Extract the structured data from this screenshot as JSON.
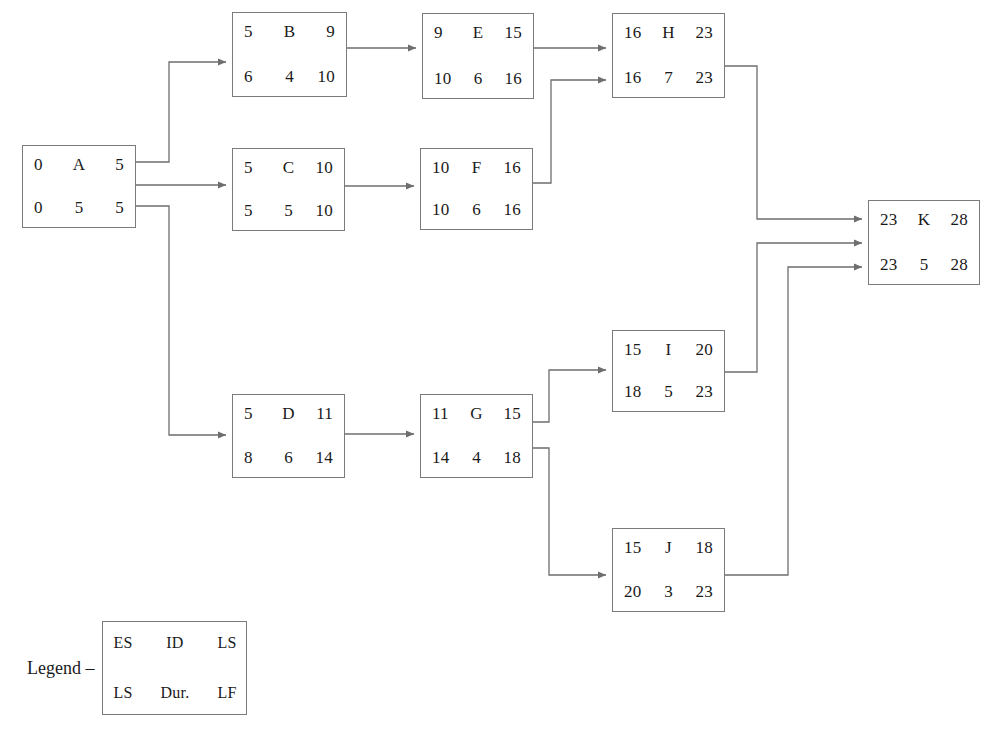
{
  "diagram": {
    "legend": {
      "label": "Legend –",
      "top_row": [
        "ES",
        "ID",
        "LS"
      ],
      "bottom_row": [
        "LS",
        "Dur.",
        "LF"
      ]
    },
    "colors": {
      "background": "#ffffff",
      "box_border": "#7b7b7b",
      "edge_line": "#6e6e6e",
      "text": "#1a1a1a"
    },
    "nodes": [
      {
        "key": "A",
        "id": "A",
        "es": "0",
        "ls_top": "5",
        "ls_bottom": "0",
        "dur": "5",
        "lf": "5"
      },
      {
        "key": "B",
        "id": "B",
        "es": "5",
        "ls_top": "9",
        "ls_bottom": "6",
        "dur": "4",
        "lf": "10"
      },
      {
        "key": "C",
        "id": "C",
        "es": "5",
        "ls_top": "10",
        "ls_bottom": "5",
        "dur": "5",
        "lf": "10"
      },
      {
        "key": "D",
        "id": "D",
        "es": "5",
        "ls_top": "11",
        "ls_bottom": "8",
        "dur": "6",
        "lf": "14"
      },
      {
        "key": "E",
        "id": "E",
        "es": "9",
        "ls_top": "15",
        "ls_bottom": "10",
        "dur": "6",
        "lf": "16"
      },
      {
        "key": "F",
        "id": "F",
        "es": "10",
        "ls_top": "16",
        "ls_bottom": "10",
        "dur": "6",
        "lf": "16"
      },
      {
        "key": "G",
        "id": "G",
        "es": "11",
        "ls_top": "15",
        "ls_bottom": "14",
        "dur": "4",
        "lf": "18"
      },
      {
        "key": "H",
        "id": "H",
        "es": "16",
        "ls_top": "23",
        "ls_bottom": "16",
        "dur": "7",
        "lf": "23"
      },
      {
        "key": "I",
        "id": "I",
        "es": "15",
        "ls_top": "20",
        "ls_bottom": "18",
        "dur": "5",
        "lf": "23"
      },
      {
        "key": "J",
        "id": "J",
        "es": "15",
        "ls_top": "18",
        "ls_bottom": "20",
        "dur": "3",
        "lf": "23"
      },
      {
        "key": "K",
        "id": "K",
        "es": "23",
        "ls_top": "28",
        "ls_bottom": "23",
        "dur": "5",
        "lf": "28"
      }
    ],
    "edges": [
      {
        "from": "A",
        "to": "B"
      },
      {
        "from": "A",
        "to": "C"
      },
      {
        "from": "A",
        "to": "D"
      },
      {
        "from": "B",
        "to": "E"
      },
      {
        "from": "C",
        "to": "F"
      },
      {
        "from": "D",
        "to": "G"
      },
      {
        "from": "E",
        "to": "H"
      },
      {
        "from": "F",
        "to": "H"
      },
      {
        "from": "G",
        "to": "I"
      },
      {
        "from": "G",
        "to": "J"
      },
      {
        "from": "H",
        "to": "K"
      },
      {
        "from": "I",
        "to": "K"
      },
      {
        "from": "J",
        "to": "K"
      }
    ]
  }
}
